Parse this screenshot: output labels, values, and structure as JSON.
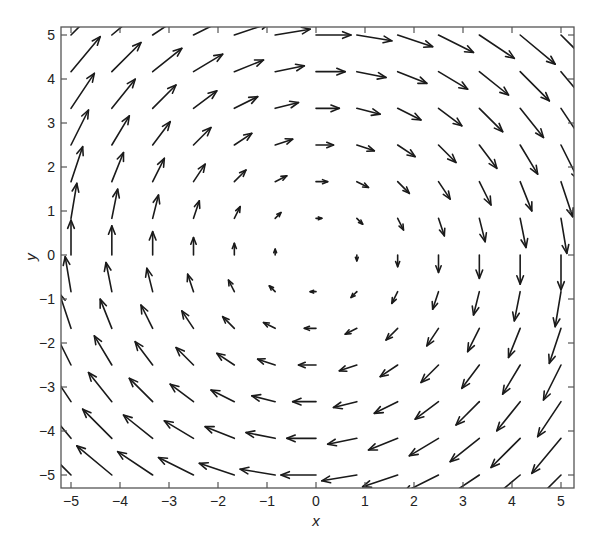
{
  "chart_data": {
    "type": "quiver",
    "title": "",
    "xlabel": "x",
    "ylabel": "y",
    "field": {
      "u": "y",
      "v": "-x",
      "description": "Clockwise rotational vector field F(x,y) = (y, -x)"
    },
    "grid": {
      "x_start": -5,
      "x_end": 5,
      "y_start": -5,
      "y_end": 5,
      "count": 13,
      "step": 0.8333
    },
    "xlim": [
      -5.22,
      5.18
    ],
    "ylim": [
      -5.3,
      5.18
    ],
    "xticks": [
      -5,
      -4,
      -3,
      -2,
      -1,
      0,
      1,
      2,
      3,
      4,
      5
    ],
    "yticks": [
      -5,
      -4,
      -3,
      -2,
      -1,
      0,
      1,
      2,
      3,
      4,
      5
    ],
    "xtick_labels": [
      "−5",
      "−4",
      "−3",
      "−2",
      "−1",
      "0",
      "1",
      "2",
      "3",
      "4",
      "5"
    ],
    "ytick_labels": [
      "−5",
      "−4",
      "−3",
      "−2",
      "−1",
      "0",
      "1",
      "2",
      "3",
      "4",
      "5"
    ],
    "grid_lines": false,
    "legend": null,
    "arrow_scale_px_per_unit": 7,
    "colors": {
      "arrow": "#1a1a1a",
      "frame": "#555555",
      "text": "#222222"
    }
  },
  "axes": {
    "xlabel": "x",
    "ylabel": "y"
  }
}
